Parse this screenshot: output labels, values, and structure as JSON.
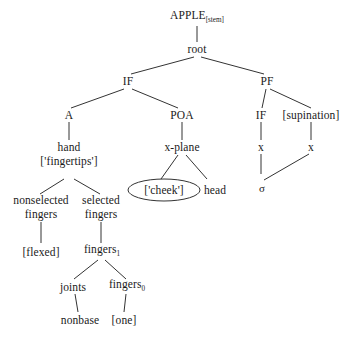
{
  "diagram": {
    "line_color": "#333333",
    "text_color": "#1a1a1a",
    "ellipse_stroke": "#333333"
  },
  "nodes": {
    "apple": {
      "label": "APPLE",
      "subscript": "[stem]"
    },
    "root": {
      "label": "root"
    },
    "if_top": {
      "label": "IF"
    },
    "pf": {
      "label": "PF"
    },
    "a": {
      "label": "A"
    },
    "poa": {
      "label": "POA"
    },
    "if_pf": {
      "label": "IF"
    },
    "supination": {
      "label": "[supination]"
    },
    "hand": {
      "label": "hand"
    },
    "fingertips": {
      "label": "['fingertips']"
    },
    "xplane": {
      "label": "x-plane"
    },
    "x_left": {
      "label": "x"
    },
    "x_right": {
      "label": "x"
    },
    "sigma": {
      "label": "σ"
    },
    "cheek": {
      "label": "['cheek']"
    },
    "head": {
      "label": "head"
    },
    "nonselected_fingers": {
      "line1": "nonselected",
      "line2": "fingers"
    },
    "selected_fingers": {
      "line1": "selected",
      "line2": "fingers"
    },
    "flexed": {
      "label": "[flexed]"
    },
    "fingers1": {
      "label": "fingers",
      "subscript": "1"
    },
    "joints": {
      "label": "joints"
    },
    "fingers0": {
      "label": "fingers",
      "subscript": "0"
    },
    "nonbase": {
      "label": "nonbase"
    },
    "one": {
      "label": "[one]"
    }
  }
}
